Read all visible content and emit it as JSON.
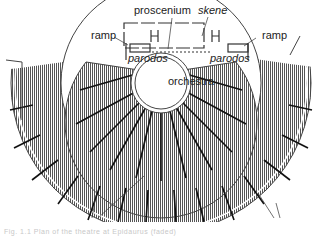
{
  "diagram": {
    "labels": {
      "proscenium": "proscenium",
      "skene": "skene",
      "ramp_left": "ramp",
      "ramp_right": "ramp",
      "parodos_left": "parodos",
      "parodos_right": "parodos",
      "orchestra": "orchestra"
    },
    "caption": "Fig. 1.1  Plan of the theatre at Epidaurus  (faded)"
  }
}
